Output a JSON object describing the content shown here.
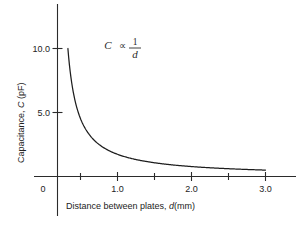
{
  "chart_data": {
    "type": "line",
    "title": "",
    "subtitle": "",
    "xlabel_prefix": "Distance between plates, ",
    "xlabel_var": "d",
    "xlabel_suffix": "(mm)",
    "ylabel_prefix": "Capacitance, ",
    "ylabel_var": "C",
    "ylabel_suffix": " (pF)",
    "xlim": [
      0,
      3.35
    ],
    "ylim": [
      0,
      11.6
    ],
    "grid": false,
    "legend": "none",
    "xticks_major": [
      "0",
      "1.0",
      "2.0",
      "3.0"
    ],
    "xticks_major_values": [
      0,
      1.0,
      2.0,
      3.0
    ],
    "xticks_minor_values": [
      0.5,
      1.5,
      2.5
    ],
    "yticks_major": [
      "5.0",
      "10.0"
    ],
    "yticks_major_values": [
      5.0,
      10.0
    ],
    "annotation": {
      "variable": "C",
      "operator": "∝",
      "numerator": "1",
      "denominator": "d",
      "text": "C ∝ 1/d"
    },
    "relation": "C = k / d",
    "k_constant": 1.5,
    "x": [
      0.15,
      0.2,
      0.25,
      0.3,
      0.35,
      0.4,
      0.5,
      0.6,
      0.7,
      0.8,
      0.9,
      1.0,
      1.2,
      1.4,
      1.6,
      1.8,
      2.0,
      2.2,
      2.4,
      2.6,
      2.8,
      3.0
    ],
    "values": [
      10.0,
      7.5,
      6.0,
      5.0,
      4.29,
      3.75,
      3.0,
      2.5,
      2.14,
      1.88,
      1.67,
      1.5,
      1.25,
      1.07,
      0.94,
      0.83,
      0.75,
      0.68,
      0.63,
      0.58,
      0.54,
      0.5
    ],
    "series": [
      {
        "name": "Capacitance vs plate separation",
        "values": [
          10.0,
          7.5,
          6.0,
          5.0,
          4.29,
          3.75,
          3.0,
          2.5,
          2.14,
          1.88,
          1.67,
          1.5,
          1.25,
          1.07,
          0.94,
          0.83,
          0.75,
          0.68,
          0.63,
          0.58,
          0.54,
          0.5
        ]
      }
    ],
    "colors": {
      "curve": "#1d1d1d",
      "axis": "#2b2b2b",
      "text": "#232323",
      "background": "#ffffff"
    }
  },
  "figure": {
    "caption": ""
  }
}
